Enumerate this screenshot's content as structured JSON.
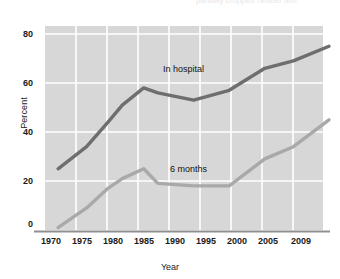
{
  "chart_data": {
    "type": "line",
    "title": "",
    "xlabel": "Year",
    "ylabel": "Percent",
    "xlim": [
      1970,
      2009
    ],
    "ylim": [
      0,
      80
    ],
    "grid": true,
    "legend_position": "inline-annotation",
    "x_ticks": [
      "1970",
      "1975",
      "1980",
      "1985",
      "1990",
      "1995",
      "2000",
      "2005",
      "2009"
    ],
    "y_ticks": [
      "0",
      "20",
      "40",
      "60",
      "80"
    ],
    "series": [
      {
        "name": "In hospital",
        "color": "#6e6e6e",
        "x": [
          1971,
          1975,
          1978,
          1980,
          1983,
          1985,
          1990,
          1995,
          2000,
          2004,
          2009
        ],
        "values": [
          25,
          34,
          44,
          51,
          58,
          56,
          53,
          57,
          66,
          69,
          75
        ]
      },
      {
        "name": "6 months",
        "color": "#a9a9a9",
        "x": [
          1971,
          1975,
          1978,
          1980,
          1983,
          1985,
          1990,
          1995,
          2000,
          2004,
          2009
        ],
        "values": [
          1,
          9,
          17,
          21,
          25,
          19,
          18,
          18,
          29,
          34,
          45
        ]
      }
    ]
  },
  "axes": {
    "y_label": "Percent",
    "x_label": "Year",
    "y_ticks": [
      {
        "label": "80",
        "value": 80
      },
      {
        "label": "60",
        "value": 60
      },
      {
        "label": "40",
        "value": 40
      },
      {
        "label": "20",
        "value": 20
      },
      {
        "label": "0",
        "value": 0
      }
    ],
    "x_ticks": [
      {
        "label": "1970",
        "value": 1970
      },
      {
        "label": "1975",
        "value": 1975
      },
      {
        "label": "1980",
        "value": 1980
      },
      {
        "label": "1985",
        "value": 1985
      },
      {
        "label": "1990",
        "value": 1990
      },
      {
        "label": "1995",
        "value": 1995
      },
      {
        "label": "2000",
        "value": 2000
      },
      {
        "label": "2005",
        "value": 2005
      },
      {
        "label": "2009",
        "value": 2009
      }
    ]
  },
  "annotations": [
    {
      "text": "In hospital",
      "x": 163,
      "y": 64
    },
    {
      "text": "6 months",
      "x": 170,
      "y": 164
    }
  ],
  "colors": {
    "plot_background": "#d7d7d7",
    "gridline": "#ffffff",
    "axis_line": "#8f8f8f",
    "series_in_hospital": "#6e6e6e",
    "series_6_months": "#a9a9a9",
    "text": "#1a1a1a"
  },
  "top_fragment": "partially cropped header text"
}
